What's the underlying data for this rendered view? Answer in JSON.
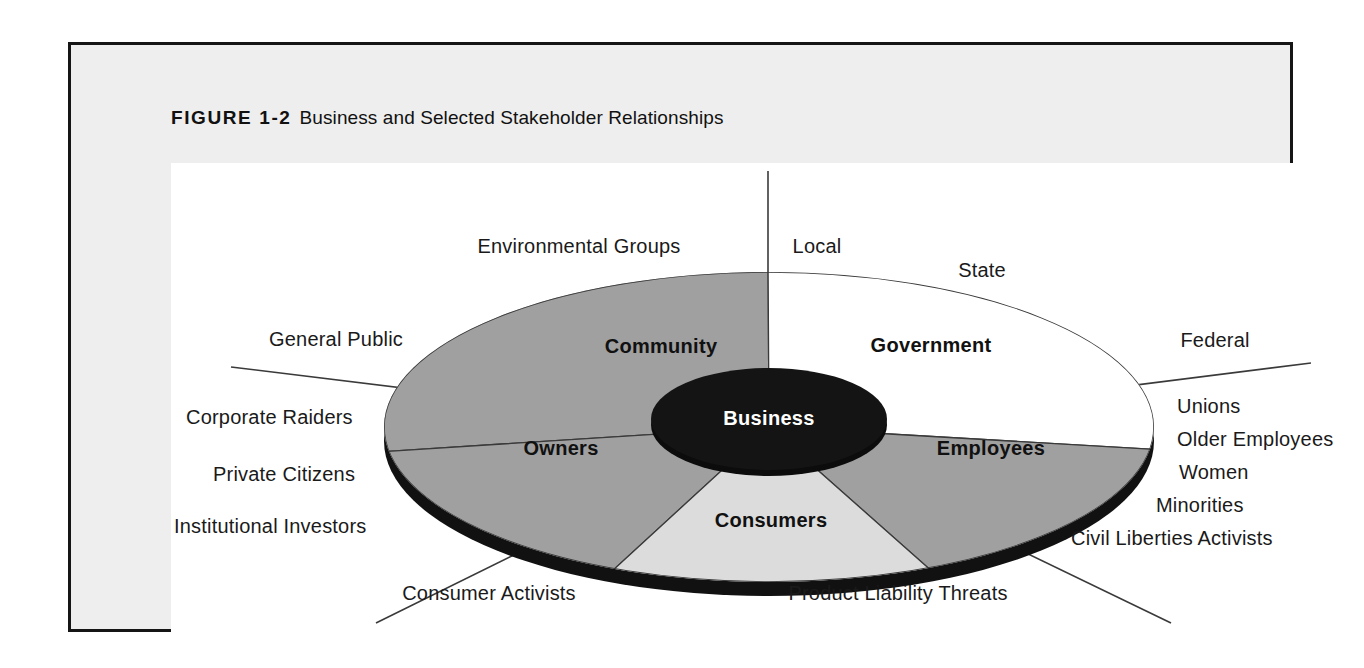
{
  "figure": {
    "label": "FIGURE 1-2",
    "caption": "Business and Selected Stakeholder Relationships"
  },
  "core": {
    "label": "Business"
  },
  "wedges": [
    {
      "name": "community",
      "label": "Community",
      "fill": "#a0a0a0"
    },
    {
      "name": "government",
      "label": "Government",
      "fill": "#ffffff"
    },
    {
      "name": "employees",
      "label": "Employees",
      "fill": "#a0a0a0"
    },
    {
      "name": "consumers",
      "label": "Consumers",
      "fill": "#dcdcdc"
    },
    {
      "name": "owners",
      "label": "Owners",
      "fill": "#a0a0a0"
    }
  ],
  "stakeholders": {
    "community": [
      "Environmental Groups",
      "General Public"
    ],
    "government": [
      "Local",
      "State",
      "Federal"
    ],
    "employees": [
      "Unions",
      "Older Employees",
      "Women",
      "Minorities",
      "Civil Liberties Activists"
    ],
    "consumers": [
      "Consumer Activists",
      "Product Liability Threats"
    ],
    "owners": [
      "Corporate Raiders",
      "Private Citizens",
      "Institutional Investors"
    ]
  },
  "colors": {
    "frame_border": "#151515",
    "frame_fill": "#eeeeee",
    "canvas": "#ffffff",
    "disc_gray": "#a0a0a0",
    "disc_light": "#dcdcdc",
    "disc_white": "#ffffff",
    "rim_black": "#111111",
    "core_black": "#141414",
    "line": "#3a3a3a",
    "text": "#1a1a1a"
  }
}
